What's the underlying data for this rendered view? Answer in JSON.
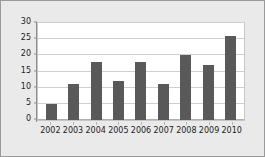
{
  "chart_data": {
    "type": "bar",
    "title": "",
    "subtitle": "",
    "xlabel": "",
    "ylabel": "",
    "categories": [
      "2002",
      "2003",
      "2004",
      "2005",
      "2006",
      "2007",
      "2008",
      "2009",
      "2010"
    ],
    "values": [
      5,
      11,
      18,
      12,
      18,
      11,
      20,
      17,
      26
    ],
    "series": [
      {
        "name": "",
        "values": [
          5,
          11,
          18,
          12,
          18,
          11,
          20,
          17,
          26
        ],
        "color": "#595959"
      }
    ],
    "ylim": [
      0,
      30
    ],
    "ytick_values": [
      0,
      5,
      10,
      15,
      20,
      25,
      30
    ],
    "ytick_labels": [
      "0",
      "5",
      "10",
      "15",
      "20",
      "25",
      "30"
    ],
    "xtick_labels": [
      "2002",
      "2003",
      "2004",
      "2005",
      "2006",
      "2007",
      "2008",
      "2009",
      "2010"
    ],
    "grid": true,
    "grid_axis": "y",
    "legend": false,
    "legend_position": "none",
    "annotations": []
  },
  "style": {
    "bar_color": "#595959",
    "plot_background": "#ffffff",
    "figure_background": "#eaeaea",
    "gridline_color": "#cfcfcf",
    "axis_color": "#8c8c8c",
    "border_color": "#9a9a9a",
    "text_color": "#222222"
  }
}
